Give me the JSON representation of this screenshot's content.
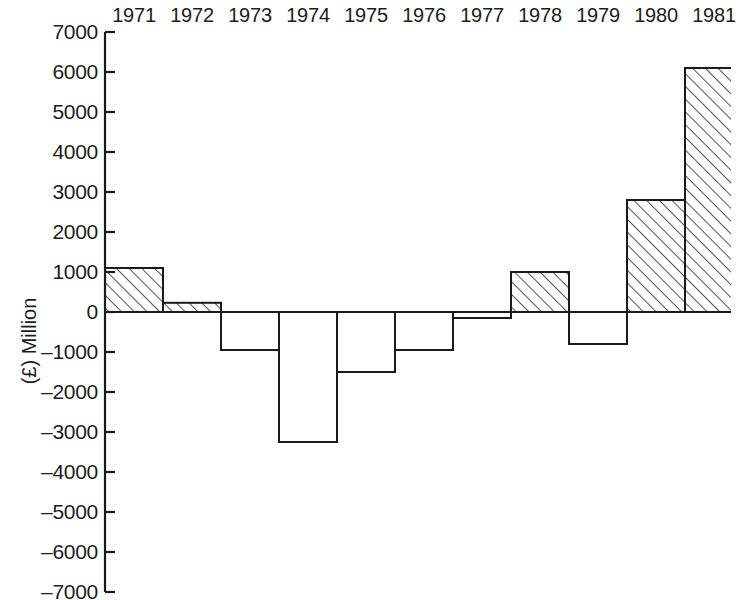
{
  "chart_data": {
    "type": "bar",
    "xlabel": "",
    "ylabel": "(£) Million",
    "categories": [
      "1971",
      "1972",
      "1973",
      "1974",
      "1975",
      "1976",
      "1977",
      "1978",
      "1979",
      "1980",
      "1981"
    ],
    "values": [
      1100,
      230,
      -950,
      -3250,
      -1500,
      -950,
      -150,
      1000,
      -800,
      2800,
      6100
    ],
    "ylim": [
      -7000,
      7000
    ],
    "ytick_labels": [
      "7000",
      "6000",
      "5000",
      "4000",
      "3000",
      "2000",
      "1000",
      "0",
      "–1000",
      "–2000",
      "–3000",
      "–4000",
      "–5000",
      "–6000",
      "–7000"
    ],
    "ytick_values": [
      7000,
      6000,
      5000,
      4000,
      3000,
      2000,
      1000,
      0,
      -1000,
      -2000,
      -3000,
      -4000,
      -5000,
      -6000,
      -7000
    ],
    "grid": false,
    "legend": null,
    "bar_fill_positive": "hatched",
    "bar_fill_negative": "none",
    "line_color": "#1a1a1a",
    "zero_line_color": "#8c8c8c",
    "background_color": "#ffffff"
  },
  "axis_geometry": {
    "zero_y_px": 312,
    "px_per_1000": 40,
    "plot_left_px": 105,
    "bar_width_px": 58,
    "top_y_px": 32,
    "bottom_y_px": 592
  }
}
